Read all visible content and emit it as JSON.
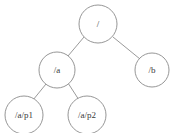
{
  "diagram": {
    "type": "tree",
    "title": "",
    "background_color": "#ffffff",
    "node_fill_color": "#ffffff",
    "node_stroke_color": "#8a8a8a",
    "edge_color": "#8f8f8f",
    "text_color": "#3a3a3a",
    "nodes": [
      {
        "id": "root",
        "label": "/",
        "cx": 98,
        "cy": 24,
        "r": 19,
        "font_size": 9
      },
      {
        "id": "a",
        "label": "/a",
        "cx": 57,
        "cy": 70,
        "r": 18,
        "font_size": 9
      },
      {
        "id": "b",
        "label": "/b",
        "cx": 152,
        "cy": 70,
        "r": 17,
        "font_size": 9
      },
      {
        "id": "ap1",
        "label": "/a/p1",
        "cx": 24,
        "cy": 115,
        "r": 19,
        "font_size": 9
      },
      {
        "id": "ap2",
        "label": "/a/p2",
        "cx": 87,
        "cy": 115,
        "r": 19,
        "font_size": 9
      }
    ],
    "edges": [
      {
        "id": "root-a",
        "from": "root",
        "to": "a",
        "x1": 84,
        "y1": 37,
        "x2": 68,
        "y2": 56
      },
      {
        "id": "root-b",
        "from": "root",
        "to": "b",
        "x1": 113,
        "y1": 37,
        "x2": 140,
        "y2": 59
      },
      {
        "id": "a-ap1",
        "from": "a",
        "to": "ap1",
        "x1": 46,
        "y1": 84,
        "x2": 33,
        "y2": 100
      },
      {
        "id": "a-ap2",
        "from": "a",
        "to": "ap2",
        "x1": 68,
        "y1": 83,
        "x2": 79,
        "y2": 100
      }
    ]
  }
}
